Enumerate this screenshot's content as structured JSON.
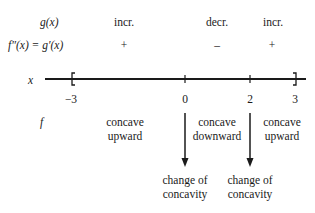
{
  "rows": {
    "g_label": "g(x)",
    "fpp_label": "f″(x) = g′(x)",
    "x_label": "x",
    "f_label": "f"
  },
  "monotonicity": [
    {
      "interval": "(-3,0)",
      "label": "incr.",
      "sign": "+"
    },
    {
      "interval": "(0,2)",
      "label": "decr.",
      "sign": "–"
    },
    {
      "interval": "(2,3)",
      "label": "incr.",
      "sign": "+"
    }
  ],
  "ticks": [
    "−3",
    "0",
    "2",
    "3"
  ],
  "concavity": [
    {
      "line1": "concave",
      "line2": "upward"
    },
    {
      "line1": "concave",
      "line2": "downward"
    },
    {
      "line1": "concave",
      "line2": "upward"
    }
  ],
  "changes": [
    {
      "at": "0",
      "line1": "change of",
      "line2": "concavity"
    },
    {
      "at": "2",
      "line1": "change of",
      "line2": "concavity"
    }
  ]
}
